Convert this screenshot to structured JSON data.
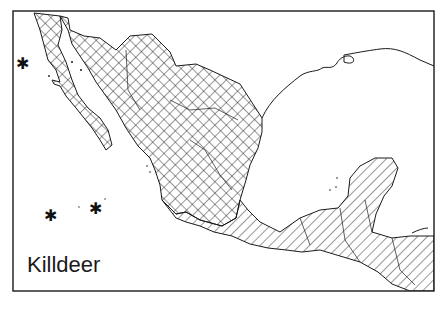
{
  "map": {
    "title": "Killdeer",
    "region": "Mexico and northern Central America",
    "legend_implied": {
      "crosshatch": "breeding and resident range",
      "diagonal_hatch": "winter range"
    },
    "markers": [
      {
        "symbol": "*",
        "meaning": "island record",
        "x": 22,
        "y": 63
      },
      {
        "symbol": "*",
        "meaning": "island record",
        "x": 50,
        "y": 214
      },
      {
        "symbol": "*",
        "meaning": "island record",
        "x": 95,
        "y": 208
      }
    ],
    "colors": {
      "ink": "#1a1a1a",
      "background": "#ffffff"
    }
  }
}
